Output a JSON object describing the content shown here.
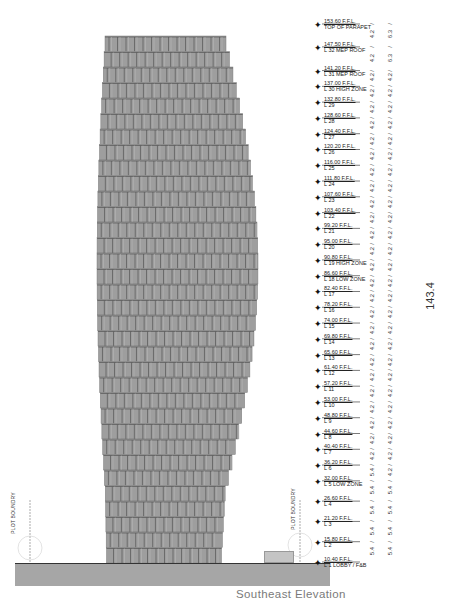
{
  "drawing": {
    "title": "Southeast Elevation",
    "total_height_dimension": "143.4",
    "plot_boundary_label": "PLOT BOUNDRY",
    "colors": {
      "facade": "#9e9e9e",
      "mullion": "#555555",
      "ground": "#a6a6a6",
      "caption": "#7a7a7a"
    }
  },
  "levels": [
    {
      "elev": "153.60 F.F.L.",
      "name": "TOP OF PARAPET"
    },
    {
      "elev": "147.50 F.F.L.",
      "name": "L 32 MEP ROOF"
    },
    {
      "elev": "141.20 F.F.L.",
      "name": "L 31 MEP ROOF"
    },
    {
      "elev": "137.00 F.F.L.",
      "name": "L 30 HIGH ZONE"
    },
    {
      "elev": "132.80 F.F.L.",
      "name": "L 29"
    },
    {
      "elev": "128.60 F.F.L.",
      "name": "L 28"
    },
    {
      "elev": "124.40 F.F.L.",
      "name": "L 27"
    },
    {
      "elev": "120.20 F.F.L.",
      "name": "L 26"
    },
    {
      "elev": "116.00 F.F.L.",
      "name": "L 25"
    },
    {
      "elev": "111.80 F.F.L.",
      "name": "L 24"
    },
    {
      "elev": "107.60 F.F.L.",
      "name": "L 23"
    },
    {
      "elev": "103.40 F.F.L.",
      "name": "L 22"
    },
    {
      "elev": "99.20 F.F.L.",
      "name": "L 21"
    },
    {
      "elev": "95.00 F.F.L.",
      "name": "L 20"
    },
    {
      "elev": "90.80 F.F.L.",
      "name": "L 19 HIGH ZONE"
    },
    {
      "elev": "86.60 F.F.L.",
      "name": "L 18 LOW ZONE"
    },
    {
      "elev": "82.40 F.F.L.",
      "name": "L 17"
    },
    {
      "elev": "78.20 F.F.L.",
      "name": "L 16"
    },
    {
      "elev": "74.00 F.F.L.",
      "name": "L 15"
    },
    {
      "elev": "69.80 F.F.L.",
      "name": "L 14"
    },
    {
      "elev": "65.60 F.F.L.",
      "name": "L 13"
    },
    {
      "elev": "61.40 F.F.L.",
      "name": "L 12"
    },
    {
      "elev": "57.20 F.F.L.",
      "name": "L 11"
    },
    {
      "elev": "53.00 F.F.L.",
      "name": "L 10"
    },
    {
      "elev": "48.80 F.F.L.",
      "name": "L 9"
    },
    {
      "elev": "44.60 F.F.L.",
      "name": "L 8"
    },
    {
      "elev": "40.40 F.F.L.",
      "name": "L 7"
    },
    {
      "elev": "36.20 F.F.L.",
      "name": "L 6"
    },
    {
      "elev": "32.00 F.F.L.",
      "name": "L 5 LOW ZONE"
    },
    {
      "elev": "26.60 F.F.L.",
      "name": "L 4"
    },
    {
      "elev": "21.20 F.F.L.",
      "name": "L 3"
    },
    {
      "elev": "15.80 F.F.L.",
      "name": "L 2"
    },
    {
      "elev": "10.40 F.F.L.",
      "name": "L 1 LOBBY / F&B"
    }
  ],
  "dimensions_col1": [
    "4.2",
    "4.2",
    "4.2",
    "4.2",
    "4.2",
    "4.2",
    "4.2",
    "4.2",
    "4.2",
    "4.2",
    "4.2",
    "4.2",
    "4.2",
    "4.2",
    "4.2",
    "4.2",
    "4.2",
    "4.2",
    "4.2",
    "4.2",
    "4.2",
    "4.2",
    "4.2",
    "4.2",
    "4.2",
    "4.2",
    "4.2",
    "5.4",
    "5.4",
    "5.4",
    "5.4",
    "5.4"
  ],
  "dimensions_col2": [
    "6.3",
    "6.3",
    "4.2",
    "4.2",
    "4.2",
    "4.2",
    "4.2",
    "4.2",
    "4.2",
    "4.2",
    "4.2",
    "4.2",
    "4.2",
    "4.2",
    "4.2",
    "4.2",
    "4.2",
    "4.2",
    "4.2",
    "4.2",
    "4.2",
    "4.2",
    "4.2",
    "4.2",
    "4.2",
    "4.2",
    "4.2",
    "4.2",
    "5.4",
    "5.4",
    "5.4",
    "5.4"
  ]
}
